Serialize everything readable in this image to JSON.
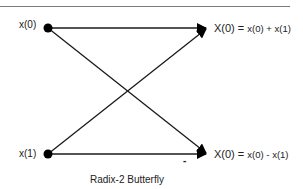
{
  "diagram": {
    "title": "Radix-2 Butterfly",
    "inputs": [
      {
        "label": "x(0)"
      },
      {
        "label": "x(1)"
      }
    ],
    "outputs": [
      {
        "lhs": "X(0) =",
        "rhs": "x(0) + x(1)"
      },
      {
        "lhs": "X(0) =",
        "rhs": "x(0) - x(1)"
      }
    ],
    "twiddle_sign": "-",
    "colors": {
      "line": "#1a1a1a",
      "node": "#000000",
      "rule": "#7a7a7a"
    }
  }
}
